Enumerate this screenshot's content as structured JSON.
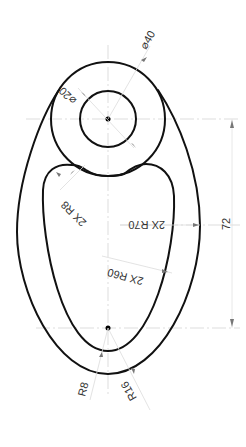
{
  "drawing": {
    "type": "technical-drawing",
    "part": "teardrop link plate with bore",
    "colors": {
      "contour": "#111111",
      "centerline": "#d4d4d4",
      "arrow": "#777777",
      "text": "#333333"
    },
    "dimensions": {
      "outer_boss_diameter": "⌀40",
      "bore_diameter": "⌀20",
      "inner_fillet": "2X R8",
      "side_arc_outer": "2X R70",
      "side_arc_inner": "2X R60",
      "center_distance": "72",
      "bottom_inner_radius": "R8",
      "bottom_outer_radius": "R16"
    }
  }
}
